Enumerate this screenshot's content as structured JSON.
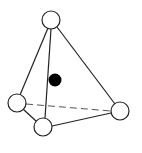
{
  "diagram": {
    "type": "tetrahedron",
    "colors": {
      "background": "#ffffff",
      "stroke": "#222222",
      "vertex_fill": "#ffffff",
      "center_fill": "#000000",
      "dash": "#555555"
    },
    "vertices": [
      {
        "id": "top",
        "cx": 51,
        "cy": 20,
        "r": 9
      },
      {
        "id": "left",
        "cx": 17,
        "cy": 103,
        "r": 9
      },
      {
        "id": "bottom",
        "cx": 43,
        "cy": 127,
        "r": 9
      },
      {
        "id": "right",
        "cx": 120,
        "cy": 111,
        "r": 9
      }
    ],
    "edges": [
      {
        "from": "top",
        "to": "left",
        "style": "solid"
      },
      {
        "from": "top",
        "to": "bottom",
        "style": "solid"
      },
      {
        "from": "top",
        "to": "right",
        "style": "solid"
      },
      {
        "from": "left",
        "to": "bottom",
        "style": "solid"
      },
      {
        "from": "bottom",
        "to": "right",
        "style": "solid"
      },
      {
        "from": "left",
        "to": "right",
        "style": "dashed"
      }
    ],
    "center_atom": {
      "cx": 55,
      "cy": 80,
      "r": 6.5
    }
  }
}
